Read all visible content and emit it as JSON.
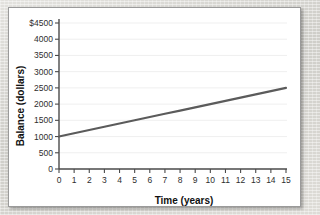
{
  "card": {
    "background_color": "#ffffff",
    "border_color": "#9a9a9a"
  },
  "chart_data": {
    "type": "line",
    "title": "",
    "xlabel": "Time (years)",
    "ylabel": "Balance (dollars)",
    "xlim": [
      0,
      15
    ],
    "ylim": [
      0,
      4500
    ],
    "grid": true,
    "legend": "none",
    "line_color": "#5b5b5b",
    "x_tick_labels": [
      "0",
      "1",
      "2",
      "3",
      "4",
      "5",
      "6",
      "7",
      "8",
      "9",
      "10",
      "11",
      "12",
      "13",
      "14",
      "15"
    ],
    "y_tick_labels": [
      "0",
      "500",
      "1000",
      "1500",
      "2000",
      "2500",
      "3000",
      "3500",
      "4000",
      "$4500"
    ],
    "y_tick_values": [
      0,
      500,
      1000,
      1500,
      2000,
      2500,
      3000,
      3500,
      4000,
      4500
    ],
    "series": [
      {
        "name": "Balance",
        "x": [
          0,
          1,
          2,
          3,
          4,
          5,
          6,
          7,
          8,
          9,
          10,
          11,
          12,
          13,
          14,
          15
        ],
        "values": [
          1000,
          1100,
          1200,
          1300,
          1400,
          1500,
          1600,
          1700,
          1800,
          1900,
          2000,
          2100,
          2200,
          2300,
          2400,
          2500
        ]
      }
    ]
  }
}
